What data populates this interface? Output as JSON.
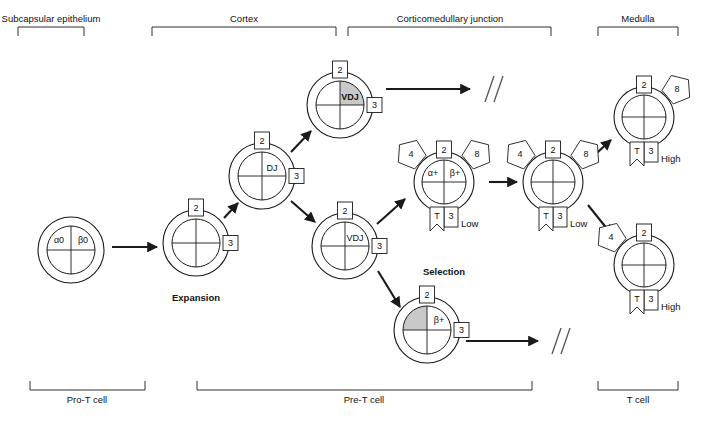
{
  "figure": {
    "type": "diagram",
    "background": "#ffffff",
    "line_color": "#1a1a1a",
    "shade_color": "#c9c9c9"
  },
  "top_regions": [
    {
      "id": "subcapsular",
      "label": "Subcapsular epithelium",
      "x1": 18,
      "x2": 84,
      "center": 51
    },
    {
      "id": "cortex",
      "label": "Cortex",
      "x1": 152,
      "x2": 336,
      "center": 244
    },
    {
      "id": "cmj",
      "label": "Corticomedullary junction",
      "x1": 348,
      "x2": 551,
      "center": 450
    },
    {
      "id": "medulla",
      "label": "Medulla",
      "x1": 598,
      "x2": 678,
      "center": 638
    }
  ],
  "bottom_regions": [
    {
      "id": "pro-t",
      "label": "Pro-T cell",
      "x1": 30,
      "x2": 145,
      "center": 87
    },
    {
      "id": "pre-t",
      "label": "Pre-T cell",
      "x1": 197,
      "x2": 532,
      "center": 364
    },
    {
      "id": "t-cell",
      "label": "T cell",
      "x1": 598,
      "x2": 678,
      "center": 638
    }
  ],
  "cells": [
    {
      "id": "pro-t-cell",
      "name": "pro-t-cell",
      "cx": 71,
      "cy": 250,
      "r_outer": 33,
      "r_inner": 24,
      "quadrant_labels": {
        "top_left": "α0",
        "top_right": "β0"
      },
      "shaded_quadrant": null,
      "receptors": [],
      "center_label": null
    },
    {
      "id": "expansion-cell",
      "name": "expansion-cell",
      "cx": 196,
      "cy": 243,
      "r_outer": 33,
      "r_inner": 24,
      "quadrant_labels": {},
      "shaded_quadrant": null,
      "receptors": [
        {
          "kind": "box",
          "value": "2",
          "position": "top"
        },
        {
          "kind": "box",
          "value": "3",
          "position": "right"
        }
      ],
      "caption": "Expansion",
      "caption_x": 196,
      "caption_y": 290
    },
    {
      "id": "dj-cell",
      "name": "dj-cell",
      "cx": 262,
      "cy": 176,
      "r_outer": 33,
      "r_inner": 24,
      "center_label": "DJ",
      "shaded_quadrant": null,
      "receptors": [
        {
          "kind": "box",
          "value": "2",
          "position": "top"
        },
        {
          "kind": "box",
          "value": "3",
          "position": "right"
        }
      ]
    },
    {
      "id": "vdj-cell-top",
      "name": "vdj-cell-shaded",
      "cx": 340,
      "cy": 105,
      "r_outer": 33,
      "r_inner": 24,
      "center_label": "VDJ",
      "center_label_bold": true,
      "shaded_quadrant": "top_right",
      "receptors": [
        {
          "kind": "box",
          "value": "2",
          "position": "top"
        },
        {
          "kind": "box",
          "value": "3",
          "position": "right"
        }
      ]
    },
    {
      "id": "vdj-cell-middle",
      "name": "vdj-cell",
      "cx": 345,
      "cy": 246,
      "r_outer": 33,
      "r_inner": 24,
      "center_label": "VDJ",
      "shaded_quadrant": null,
      "receptors": [
        {
          "kind": "box",
          "value": "2",
          "position": "top"
        },
        {
          "kind": "box",
          "value": "3",
          "position": "right"
        }
      ]
    },
    {
      "id": "beta-plus-cell",
      "name": "beta-plus-cell",
      "cx": 427,
      "cy": 330,
      "r_outer": 33,
      "r_inner": 24,
      "quadrant_labels": {
        "top_right": "β+"
      },
      "shaded_quadrant": "top_left",
      "receptors": [
        {
          "kind": "box",
          "value": "2",
          "position": "top"
        },
        {
          "kind": "box",
          "value": "3",
          "position": "right"
        }
      ]
    },
    {
      "id": "selection-cell-1",
      "name": "selection-cell-double-positive",
      "cx": 444,
      "cy": 182,
      "r_outer": 30,
      "r_inner": 22,
      "quadrant_labels": {
        "top_left": "α+",
        "top_right": "β+"
      },
      "shaded_quadrant": null,
      "receptors": [
        {
          "kind": "pentagon",
          "value": "4",
          "position": "upper_left"
        },
        {
          "kind": "box",
          "value": "2",
          "position": "top"
        },
        {
          "kind": "pentagon",
          "value": "8",
          "position": "upper_right"
        },
        {
          "kind": "tcr",
          "left": "T",
          "right": "3",
          "position": "bottom",
          "level": "Low"
        }
      ],
      "caption": "Selection",
      "caption_x": 444,
      "caption_y": 264
    },
    {
      "id": "selection-cell-2",
      "name": "selection-cell-second",
      "cx": 553,
      "cy": 182,
      "r_outer": 30,
      "r_inner": 22,
      "quadrant_labels": {},
      "shaded_quadrant": null,
      "receptors": [
        {
          "kind": "pentagon",
          "value": "4",
          "position": "upper_left"
        },
        {
          "kind": "box",
          "value": "2",
          "position": "top"
        },
        {
          "kind": "pentagon",
          "value": "8",
          "position": "upper_right"
        },
        {
          "kind": "tcr",
          "left": "T",
          "right": "3",
          "position": "bottom",
          "level": "Low"
        }
      ]
    },
    {
      "id": "cd8-t-cell",
      "name": "cd8-t-cell",
      "cx": 644,
      "cy": 117,
      "r_outer": 30,
      "r_inner": 22,
      "quadrant_labels": {},
      "shaded_quadrant": null,
      "receptors": [
        {
          "kind": "box",
          "value": "2",
          "position": "top"
        },
        {
          "kind": "pentagon",
          "value": "8",
          "position": "upper_right"
        },
        {
          "kind": "tcr",
          "left": "T",
          "right": "3",
          "position": "bottom",
          "level": "High"
        }
      ]
    },
    {
      "id": "cd4-t-cell",
      "name": "cd4-t-cell",
      "cx": 644,
      "cy": 265,
      "r_outer": 30,
      "r_inner": 22,
      "quadrant_labels": {},
      "shaded_quadrant": null,
      "receptors": [
        {
          "kind": "pentagon",
          "value": "4",
          "position": "upper_left"
        },
        {
          "kind": "box",
          "value": "2",
          "position": "top"
        },
        {
          "kind": "tcr",
          "left": "T",
          "right": "3",
          "position": "bottom",
          "level": "High"
        }
      ]
    }
  ],
  "arrows": [
    {
      "id": "a1",
      "from": "pro-t-cell",
      "to": "expansion-cell",
      "x1": 112,
      "y1": 247,
      "x2": 157,
      "y2": 247
    },
    {
      "id": "a2",
      "from": "expansion-cell",
      "to": "dj-cell",
      "x1": 224,
      "y1": 218,
      "x2": 238,
      "y2": 203
    },
    {
      "id": "a3",
      "from": "dj-cell",
      "to": "vdj-cell-top",
      "x1": 291,
      "y1": 152,
      "x2": 311,
      "y2": 131
    },
    {
      "id": "a4",
      "from": "dj-cell",
      "to": "vdj-cell-middle",
      "x1": 291,
      "y1": 201,
      "x2": 315,
      "y2": 222
    },
    {
      "id": "a5",
      "from": "vdj-cell-top",
      "to": "dead-end-top",
      "x1": 386,
      "y1": 89,
      "x2": 470,
      "y2": 89
    },
    {
      "id": "a6",
      "from": "vdj-cell-middle",
      "to": "selection-cell-1",
      "x1": 377,
      "y1": 224,
      "x2": 405,
      "y2": 199
    },
    {
      "id": "a7",
      "from": "vdj-cell-middle",
      "to": "beta-plus-cell",
      "x1": 378,
      "y1": 271,
      "x2": 400,
      "y2": 307
    },
    {
      "id": "a8",
      "from": "selection-cell-1",
      "to": "selection-cell-2",
      "x1": 489,
      "y1": 182,
      "x2": 517,
      "y2": 182
    },
    {
      "id": "a9",
      "from": "selection-cell-2",
      "to": "cd8-t-cell",
      "x1": 588,
      "y1": 161,
      "x2": 611,
      "y2": 140
    },
    {
      "id": "a10",
      "from": "selection-cell-2",
      "to": "cd4-t-cell",
      "x1": 588,
      "y1": 205,
      "x2": 612,
      "y2": 235
    },
    {
      "id": "a11",
      "from": "beta-plus-cell",
      "to": "dead-end-bottom",
      "x1": 466,
      "y1": 341,
      "x2": 538,
      "y2": 341
    }
  ],
  "dead_ends": [
    {
      "id": "dead-end-top",
      "name": "apoptosis-slash-top",
      "x": 485,
      "y": 89
    },
    {
      "id": "dead-end-bottom",
      "name": "apoptosis-slash-bottom",
      "x": 552,
      "y": 341
    }
  ],
  "captions": [
    {
      "id": "expansion",
      "text": "Expansion",
      "x": 196,
      "y": 292,
      "bold": true
    },
    {
      "id": "selection",
      "text": "Selection",
      "x": 444,
      "y": 266,
      "bold": true
    }
  ]
}
